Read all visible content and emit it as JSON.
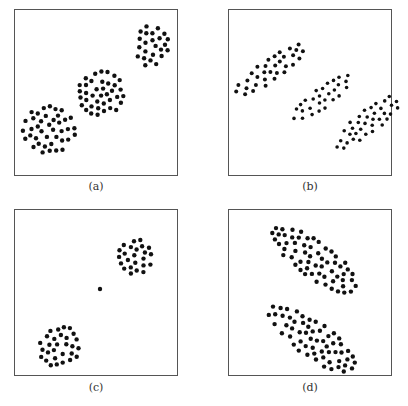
{
  "figure": {
    "panels": [
      {
        "id": "a",
        "label": "(a)",
        "box": [
          14,
          9,
          164,
          167
        ],
        "caption_pos": [
          66,
          180
        ],
        "description": "Three compact roughly circular clusters along a diagonal",
        "clusters": [
          {
            "center": [
              152,
              46
            ],
            "rx": 17,
            "ry": 21,
            "n": 25,
            "r": 2.2
          },
          {
            "center": [
              101,
              93
            ],
            "rx": 23,
            "ry": 23,
            "n": 40,
            "r": 2.2
          },
          {
            "center": [
              49,
              130
            ],
            "rx": 27,
            "ry": 24,
            "n": 40,
            "r": 2.2
          }
        ]
      },
      {
        "id": "b",
        "label": "(b)",
        "box": [
          228,
          9,
          164,
          167
        ],
        "caption_pos": [
          280,
          180
        ],
        "description": "Three elongated parallel diagonal clusters",
        "clusters": [
          {
            "center": [
              270,
              70
            ],
            "rx": 42,
            "ry": 11,
            "angle": -35,
            "n": 55,
            "r": 2.0
          },
          {
            "center": [
              322,
              98
            ],
            "rx": 38,
            "ry": 10,
            "angle": -38,
            "n": 50,
            "r": 1.8
          },
          {
            "center": [
              368,
              122
            ],
            "rx": 40,
            "ry": 12,
            "angle": -38,
            "n": 55,
            "r": 1.8
          }
        ]
      },
      {
        "id": "c",
        "label": "(c)",
        "box": [
          14,
          209,
          164,
          167
        ],
        "caption_pos": [
          66,
          389
        ],
        "description": "Two compact clusters connected by a single isolated point (noise/bridge)",
        "clusters": [
          {
            "center": [
              135,
              257
            ],
            "rx": 17,
            "ry": 18,
            "n": 30,
            "r": 2.2
          },
          {
            "center": [
              60,
              346
            ],
            "rx": 22,
            "ry": 20,
            "angle": -35,
            "n": 35,
            "r": 2.2
          }
        ],
        "outliers": [
          [
            100,
            289
          ]
        ]
      },
      {
        "id": "d",
        "label": "(d)",
        "box": [
          228,
          209,
          164,
          167
        ],
        "caption_pos": [
          280,
          389
        ],
        "description": "Two elongated parallel diagonal clusters, close to each other",
        "clusters": [
          {
            "center": [
              315,
              260
            ],
            "rx": 52,
            "ry": 18,
            "angle": 35,
            "n": 60,
            "r": 2.2
          },
          {
            "center": [
              312,
              339
            ],
            "rx": 52,
            "ry": 18,
            "angle": 35,
            "n": 60,
            "r": 2.2
          }
        ]
      }
    ]
  }
}
